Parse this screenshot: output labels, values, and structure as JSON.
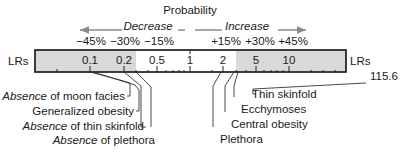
{
  "title": "Probability",
  "direction": {
    "decrease_label": "Decrease",
    "increase_label": "Increase",
    "arrow_color": "#8a8a8a"
  },
  "percent_labels": {
    "decrease": [
      "−45%",
      "−30%",
      "−15%"
    ],
    "increase": [
      "+15%",
      "+30%",
      "+45%"
    ]
  },
  "scale": {
    "axis_label_left": "LRs",
    "axis_label_right": "LRs",
    "tick_labels": [
      "0.1",
      "0.2",
      "0.5",
      "1",
      "2",
      "5",
      "10"
    ],
    "shade_color": "#d9d9d9",
    "shaded_left_range": [
      0.05,
      0.24
    ],
    "shaded_right_range": [
      3.3,
      20
    ]
  },
  "findings_decrease": [
    {
      "italic": "Absence",
      "rest": " of moon facies",
      "lr": 0.1
    },
    {
      "italic": "",
      "rest": "Generalized obesity",
      "lr": 0.2
    },
    {
      "italic": "Absence",
      "rest": " of thin skinfold",
      "lr": 0.22
    },
    {
      "italic": "Absence",
      "rest": " of plethora",
      "lr": 0.24
    }
  ],
  "findings_increase": [
    {
      "italic": "",
      "rest": "Thin skinfold",
      "lr": 115.6,
      "value_label": "115.6"
    },
    {
      "italic": "",
      "rest": "Ecchymoses",
      "lr": 4.3
    },
    {
      "italic": "",
      "rest": "Central obesity",
      "lr": 3.0
    },
    {
      "italic": "",
      "rest": "Plethora",
      "lr": 2.7
    }
  ],
  "outlier_value_label": "115.6"
}
